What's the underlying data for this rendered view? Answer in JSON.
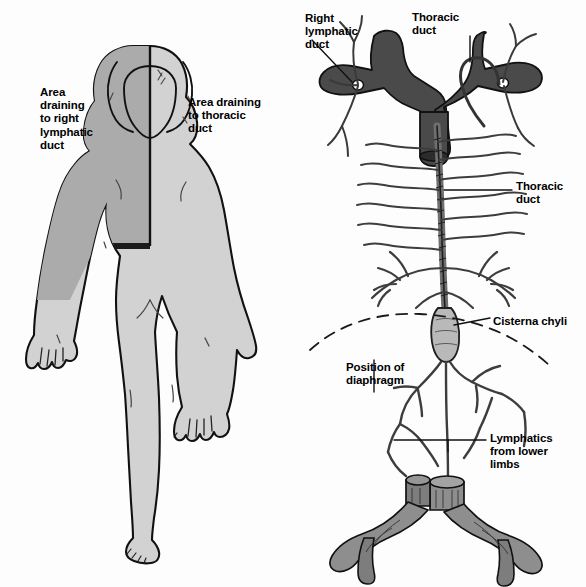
{
  "figure": {
    "background_color": "#fdfdfd",
    "ink_color": "#000000"
  },
  "palette": {
    "body_light_fill": "#d2d2d2",
    "body_shaded_fill": "#ababab",
    "vein_dark_fill": "#4a4a4a",
    "vein_mid_fill": "#8e8e8e",
    "duct_fill": "#b9b9b9",
    "outline": "#000000",
    "highlight": "#ffffff"
  },
  "left_panel": {
    "name": "body-drainage-figure",
    "description": "Posterior view of a human body divided by a vertical midline, the upper right quadrant shaded darker",
    "labels": {
      "area_right_lymphatic_duct": "Area\ndraining\nto right\nlymphatic\nduct",
      "area_thoracic_duct": "Area draining\nto thoracic\nduct"
    }
  },
  "right_panel": {
    "name": "thoracic-duct-figure",
    "description": "The thoracic duct ascending from the cisterna chyli to the left brachiocephalic vein, with the right lymphatic duct entering on the opposite side",
    "labels": {
      "right_lymphatic_duct": "Right\nlymphatic\nduct",
      "thoracic_duct_top": "Thoracic\nduct",
      "thoracic_duct_mid": "Thoracic\nduct",
      "cisterna_chyli": "Cisterna chyli",
      "position_of_diaphragm": "Position of\ndiaphragm",
      "lymphatics_lower_limbs": "Lymphatics\nfrom lower\nlimbs"
    }
  }
}
